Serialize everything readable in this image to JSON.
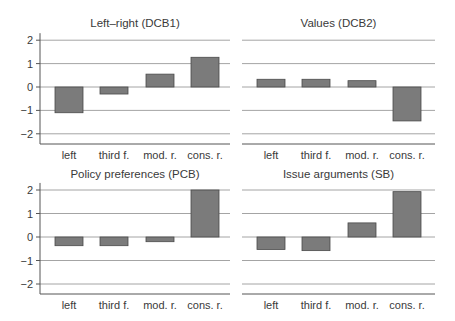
{
  "chart_data": [
    {
      "type": "bar",
      "title": "Left–right (DCB1)",
      "categories": [
        "left",
        "third f.",
        "mod. r.",
        "cons. r."
      ],
      "values": [
        -1.1,
        -0.3,
        0.55,
        1.27
      ],
      "xlabel": "",
      "ylabel": "",
      "ylim": [
        -2.4,
        2.3
      ],
      "yticks": [
        2,
        1,
        0,
        -1,
        -2
      ],
      "ytick_labels": [
        "2",
        "1",
        "0",
        "−1",
        "−2"
      ],
      "grid": true,
      "position": "top-left"
    },
    {
      "type": "bar",
      "title": "Values (DCB2)",
      "categories": [
        "left",
        "third f.",
        "mod. r.",
        "cons. r."
      ],
      "values": [
        0.33,
        0.33,
        0.27,
        -1.45
      ],
      "xlabel": "",
      "ylabel": "",
      "ylim": [
        -2.4,
        2.3
      ],
      "yticks": [
        2,
        1,
        0,
        -1,
        -2
      ],
      "ytick_labels": [
        "2",
        "1",
        "0",
        "−1",
        "−2"
      ],
      "grid": true,
      "position": "top-right"
    },
    {
      "type": "bar",
      "title": "Policy preferences (PCB)",
      "categories": [
        "left",
        "third f.",
        "mod. r.",
        "cons. r."
      ],
      "values": [
        -0.37,
        -0.37,
        -0.2,
        2.0
      ],
      "xlabel": "",
      "ylabel": "",
      "ylim": [
        -2.4,
        2.3
      ],
      "yticks": [
        2,
        1,
        0,
        -1,
        -2
      ],
      "ytick_labels": [
        "2",
        "1",
        "0",
        "−1",
        "−2"
      ],
      "grid": true,
      "position": "bottom-left"
    },
    {
      "type": "bar",
      "title": "Issue arguments (SB)",
      "categories": [
        "left",
        "third f.",
        "mod. r.",
        "cons. r."
      ],
      "values": [
        -0.53,
        -0.58,
        0.6,
        1.93
      ],
      "xlabel": "",
      "ylabel": "",
      "ylim": [
        -2.4,
        2.3
      ],
      "yticks": [
        2,
        1,
        0,
        -1,
        -2
      ],
      "ytick_labels": [
        "2",
        "1",
        "0",
        "−1",
        "−2"
      ],
      "grid": true,
      "position": "bottom-right"
    }
  ],
  "colors": {
    "bar_fill": "#7b7b7b",
    "bar_stroke": "#4a4a4a",
    "grid": "#9a9a9a",
    "text": "#3a3a3a"
  }
}
